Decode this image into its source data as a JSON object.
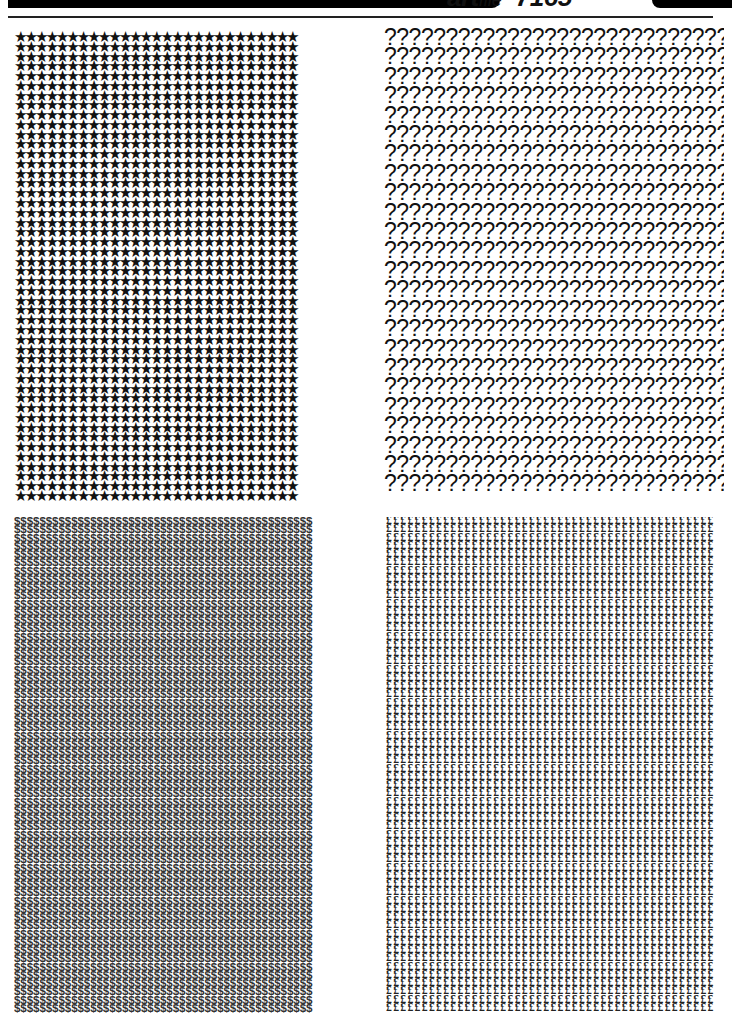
{
  "header": {
    "brand_bold": "art",
    "brand_light": "file",
    "number": "7165"
  },
  "panels": [
    {
      "name": "asterisk-pattern",
      "glyph": "★",
      "columns": 27,
      "rows": 48
    },
    {
      "name": "question-mark-pattern",
      "glyph": "?",
      "columns": 29,
      "rows": 24
    },
    {
      "name": "dollar-pattern",
      "glyph": "$",
      "columns": 47,
      "rows": 60
    },
    {
      "name": "pound-pattern",
      "glyph": "£",
      "columns": 46,
      "rows": 60
    }
  ]
}
